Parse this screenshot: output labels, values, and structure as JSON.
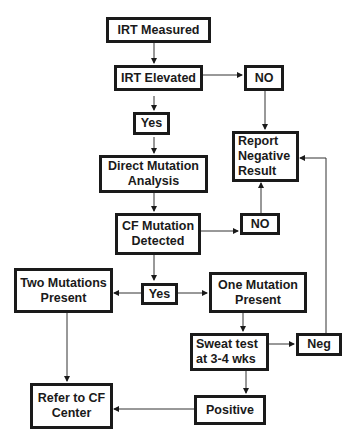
{
  "diagram": {
    "type": "flowchart",
    "nodes": {
      "irt_measured": {
        "label": "IRT Measured"
      },
      "irt_elevated": {
        "label": "IRT Elevated"
      },
      "no_top": {
        "label": "NO"
      },
      "yes_top": {
        "label": "Yes"
      },
      "report_negative": {
        "label": "Report\nNegative\nResult"
      },
      "direct_mutation": {
        "label": "Direct Mutation\nAnalysis"
      },
      "cf_mutation": {
        "label": "CF Mutation\nDetected"
      },
      "no_mid": {
        "label": "NO"
      },
      "two_mutations": {
        "label": "Two Mutations\nPresent"
      },
      "yes_mid": {
        "label": "Yes"
      },
      "one_mutation": {
        "label": "One Mutation\nPresent"
      },
      "sweat_test": {
        "label": "Sweat test\nat 3-4 wks"
      },
      "neg": {
        "label": "Neg"
      },
      "refer_cf": {
        "label": "Refer to CF\nCenter"
      },
      "positive": {
        "label": "Positive"
      }
    },
    "edges": [
      [
        "irt_measured",
        "irt_elevated"
      ],
      [
        "irt_elevated",
        "no_top"
      ],
      [
        "irt_elevated",
        "yes_top"
      ],
      [
        "no_top",
        "report_negative"
      ],
      [
        "yes_top",
        "direct_mutation"
      ],
      [
        "direct_mutation",
        "cf_mutation"
      ],
      [
        "cf_mutation",
        "no_mid"
      ],
      [
        "no_mid",
        "report_negative"
      ],
      [
        "cf_mutation",
        "yes_mid"
      ],
      [
        "yes_mid",
        "two_mutations"
      ],
      [
        "yes_mid",
        "one_mutation"
      ],
      [
        "two_mutations",
        "refer_cf"
      ],
      [
        "one_mutation",
        "sweat_test"
      ],
      [
        "sweat_test",
        "neg"
      ],
      [
        "neg",
        "report_negative"
      ],
      [
        "sweat_test",
        "positive"
      ],
      [
        "positive",
        "refer_cf"
      ]
    ]
  }
}
